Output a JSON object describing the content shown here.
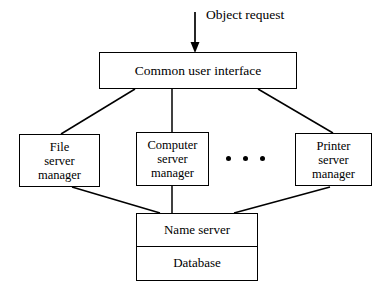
{
  "diagram": {
    "background_color": "#ffffff",
    "line_color": "#000000",
    "annotations": {
      "object_request": "Object request",
      "ellipsis": "• • •"
    },
    "nodes": {
      "common_interface": {
        "label": "Common user interface"
      },
      "file_manager": {
        "line1": "File",
        "line2": "server",
        "line3": "manager"
      },
      "computer_manager": {
        "line1": "Computer",
        "line2": "server",
        "line3": "manager"
      },
      "printer_manager": {
        "line1": "Printer",
        "line2": "server",
        "line3": "manager"
      },
      "name_server": {
        "label": "Name server"
      },
      "database": {
        "label": "Database"
      }
    }
  }
}
